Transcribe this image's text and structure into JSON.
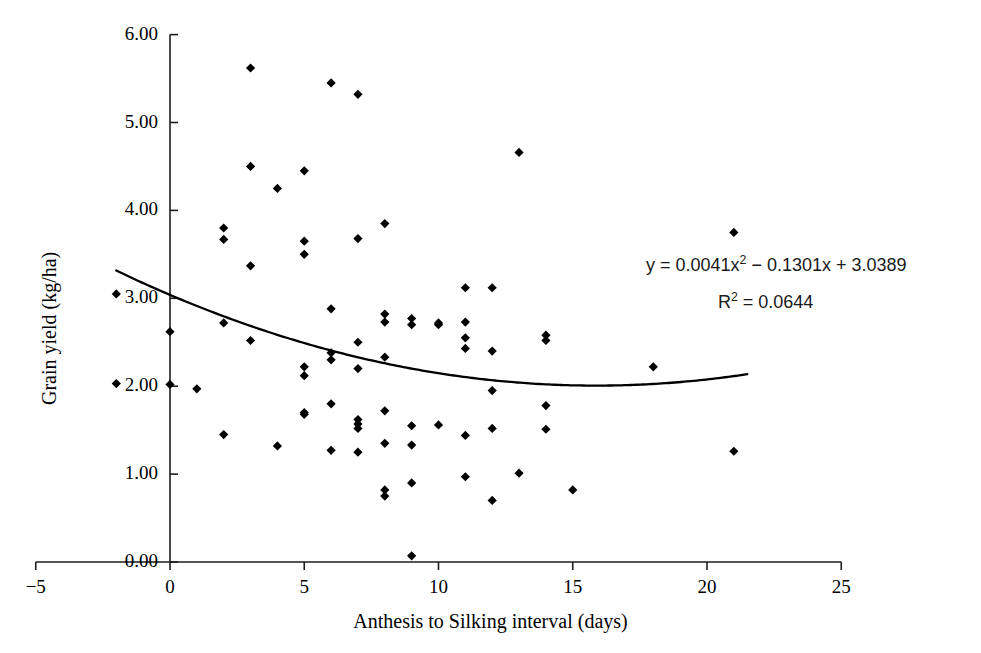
{
  "chart_data": {
    "type": "scatter",
    "title": "",
    "xlabel": "Anthesis to Silking interval (days)",
    "ylabel": "Grain yield (kg/ha)",
    "xlim": [
      -5,
      25
    ],
    "ylim": [
      0.0,
      6.0
    ],
    "xticks": [
      -5,
      0,
      5,
      10,
      15,
      20,
      25
    ],
    "xtick_labels": [
      "−5",
      "0",
      "5",
      "10",
      "15",
      "20",
      "25"
    ],
    "yticks": [
      0.0,
      1.0,
      2.0,
      3.0,
      4.0,
      5.0,
      6.0
    ],
    "ytick_labels": [
      "0.00",
      "1.00",
      "2.00",
      "3.00",
      "4.00",
      "5.00",
      "6.00"
    ],
    "grid": false,
    "legend": false,
    "marker": "diamond",
    "marker_color": "#000000",
    "series": [
      {
        "name": "Grain yield vs ASI",
        "points": [
          [
            -2.0,
            3.05
          ],
          [
            -2.0,
            2.03
          ],
          [
            0.0,
            2.62
          ],
          [
            0.0,
            2.02
          ],
          [
            1.0,
            1.97
          ],
          [
            2.0,
            3.8
          ],
          [
            2.0,
            3.67
          ],
          [
            2.0,
            2.72
          ],
          [
            2.0,
            1.45
          ],
          [
            3.0,
            5.62
          ],
          [
            3.0,
            4.5
          ],
          [
            3.0,
            3.37
          ],
          [
            3.0,
            2.52
          ],
          [
            4.0,
            4.25
          ],
          [
            4.0,
            1.32
          ],
          [
            5.0,
            4.45
          ],
          [
            5.0,
            3.65
          ],
          [
            5.0,
            3.5
          ],
          [
            5.0,
            2.22
          ],
          [
            5.0,
            2.12
          ],
          [
            5.0,
            1.7
          ],
          [
            5.0,
            1.68
          ],
          [
            6.0,
            5.45
          ],
          [
            6.0,
            2.88
          ],
          [
            6.0,
            2.38
          ],
          [
            6.0,
            2.3
          ],
          [
            6.0,
            1.8
          ],
          [
            6.0,
            1.27
          ],
          [
            7.0,
            5.32
          ],
          [
            7.0,
            3.68
          ],
          [
            7.0,
            2.5
          ],
          [
            7.0,
            2.2
          ],
          [
            7.0,
            1.62
          ],
          [
            7.0,
            1.57
          ],
          [
            7.0,
            1.52
          ],
          [
            7.0,
            1.25
          ],
          [
            8.0,
            3.85
          ],
          [
            8.0,
            2.82
          ],
          [
            8.0,
            2.73
          ],
          [
            8.0,
            2.33
          ],
          [
            8.0,
            1.72
          ],
          [
            8.0,
            1.35
          ],
          [
            8.0,
            0.82
          ],
          [
            8.0,
            0.75
          ],
          [
            9.0,
            2.77
          ],
          [
            9.0,
            2.7
          ],
          [
            9.0,
            1.55
          ],
          [
            9.0,
            1.33
          ],
          [
            9.0,
            0.9
          ],
          [
            9.0,
            0.07
          ],
          [
            10.0,
            2.72
          ],
          [
            10.0,
            2.7
          ],
          [
            10.0,
            1.56
          ],
          [
            11.0,
            3.12
          ],
          [
            11.0,
            2.73
          ],
          [
            11.0,
            2.55
          ],
          [
            11.0,
            2.43
          ],
          [
            11.0,
            1.44
          ],
          [
            11.0,
            0.97
          ],
          [
            12.0,
            3.12
          ],
          [
            12.0,
            2.4
          ],
          [
            12.0,
            1.95
          ],
          [
            12.0,
            1.52
          ],
          [
            12.0,
            0.7
          ],
          [
            13.0,
            4.66
          ],
          [
            13.0,
            1.01
          ],
          [
            14.0,
            2.58
          ],
          [
            14.0,
            2.52
          ],
          [
            14.0,
            1.78
          ],
          [
            14.0,
            1.51
          ],
          [
            15.0,
            0.82
          ],
          [
            18.0,
            2.22
          ],
          [
            21.0,
            3.75
          ],
          [
            21.0,
            1.26
          ]
        ]
      }
    ],
    "trendline": {
      "type": "polynomial",
      "order": 2,
      "coefficients": [
        0.0041,
        -0.1301,
        3.0389
      ],
      "x_start": -2.0,
      "x_end": 21.5,
      "color": "#000000"
    },
    "annotations": [
      {
        "name": "regression-equation",
        "text_plain": "y = 0.0041x2 − 0.1301x + 3.0389",
        "parts": [
          "y = 0.0041x",
          "2",
          " − 0.1301x + 3.0389"
        ]
      },
      {
        "name": "r-squared",
        "text_plain": "R2 = 0.0644",
        "parts": [
          "R",
          "2",
          " = 0.0644"
        ]
      }
    ]
  }
}
